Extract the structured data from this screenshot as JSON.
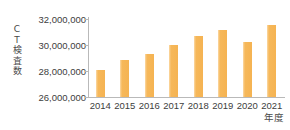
{
  "chart_data": {
    "type": "bar",
    "title": "",
    "categories": [
      "2014",
      "2015",
      "2016",
      "2017",
      "2018",
      "2019",
      "2020",
      "2021"
    ],
    "values": [
      28080000,
      28850000,
      29310000,
      30000000,
      30690000,
      31150000,
      30230000,
      31540000
    ],
    "series": [
      {
        "name": "CT検査数",
        "values": [
          28080000,
          28850000,
          29310000,
          30000000,
          30690000,
          31150000,
          30230000,
          31540000
        ]
      }
    ],
    "xlabel": "年度",
    "ylabel": "ＣＴ検査数",
    "ylabel_stacked": "C\nT\n検\n査\n数",
    "ylim": [
      26000000,
      32000000
    ],
    "ytick_values": [
      32000000,
      30000000,
      28000000,
      26000000
    ],
    "ytick_labels": [
      "32,000,000",
      "30,000,000",
      "28,000,000",
      "26,000,000"
    ],
    "grid": false,
    "legend": false,
    "bar_color": "#f5b352",
    "bar_highlight_color": "#fbd9a6",
    "axis_color": "#b9b9b9",
    "text_color": "#3d3d3d",
    "background_color": "#ffffff"
  }
}
